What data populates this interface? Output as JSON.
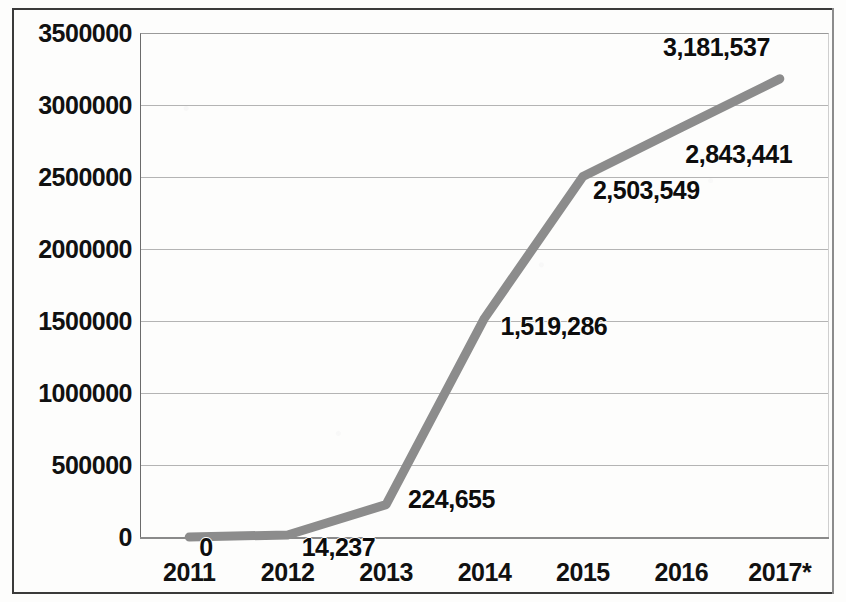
{
  "chart_data": {
    "type": "line",
    "title": "",
    "subtitle": "",
    "xlabel": "",
    "ylabel": "",
    "categories": [
      "2011",
      "2012",
      "2013",
      "2014",
      "2015",
      "2016",
      "2017*"
    ],
    "values": [
      0,
      14237,
      224655,
      1519286,
      2503549,
      2843441,
      3181537
    ],
    "point_labels": [
      "0",
      "14,237",
      "224,655",
      "1,519,286",
      "2,503,549",
      "2,843,441",
      "3,181,537"
    ],
    "series": [
      {
        "name": "",
        "values": [
          0,
          14237,
          224655,
          1519286,
          2503549,
          2843441,
          3181537
        ],
        "color": "#8c8c8c"
      }
    ],
    "ylim": [
      0,
      3500000
    ],
    "ytick_labels": [
      "0",
      "500000",
      "1000000",
      "1500000",
      "2000000",
      "2500000",
      "3000000",
      "3500000"
    ],
    "ytick_values": [
      0,
      500000,
      1000000,
      1500000,
      2000000,
      2500000,
      3000000,
      3500000
    ],
    "xtick_labels": [
      "2011",
      "2012",
      "2013",
      "2014",
      "2015",
      "2016",
      "2017*"
    ],
    "grid": true,
    "legend": "none",
    "line_color": "#8c8c8c",
    "axis_color": "#6b6b6b",
    "grid_color": "#b4b4b4",
    "label_color": "#111111"
  }
}
